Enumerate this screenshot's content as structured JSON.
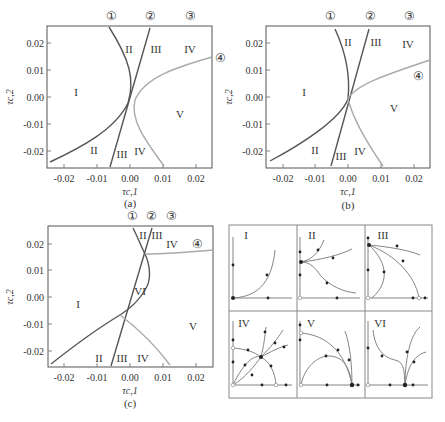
{
  "figure": {
    "panels": [
      {
        "id": "a",
        "caption": "(a)",
        "xlabel": "τc,1",
        "ylabel": "τc,2",
        "xticks": [
          "-0.02",
          "-0.01",
          "0.00",
          "0.01",
          "0.02"
        ],
        "yticks": [
          "0.02",
          "0.01",
          "0.00",
          "-0.01",
          "-0.02"
        ],
        "curve_markers": [
          "①",
          "②",
          "③",
          "④"
        ],
        "regions": [
          "I",
          "II",
          "III",
          "IV",
          "V",
          "II",
          "III",
          "IV"
        ]
      },
      {
        "id": "b",
        "caption": "(b)",
        "xlabel": "τc,1",
        "ylabel": "τc,2",
        "xticks": [
          "-0.02",
          "-0.01",
          "0.00",
          "0.01",
          "0.02"
        ],
        "yticks": [
          "0.02",
          "0.01",
          "0.00",
          "-0.01",
          "-0.02"
        ],
        "curve_markers": [
          "①",
          "②",
          "③",
          "④"
        ],
        "regions": [
          "I",
          "II",
          "III",
          "IV",
          "V",
          "II",
          "III",
          "IV"
        ]
      },
      {
        "id": "c",
        "caption": "(c)",
        "xlabel": "τc,1",
        "ylabel": "τc,2",
        "xticks": [
          "-0.02",
          "-0.01",
          "0.00",
          "0.01",
          "0.02"
        ],
        "yticks": [
          "0.02",
          "0.01",
          "0.00",
          "-0.01",
          "-0.02"
        ],
        "curve_markers": [
          "①",
          "②",
          "③",
          "④"
        ],
        "regions": [
          "I",
          "II",
          "III",
          "IV",
          "V",
          "VI",
          "II",
          "III",
          "IV"
        ]
      }
    ],
    "phase_portraits": {
      "labels": [
        "I",
        "II",
        "III",
        "IV",
        "V",
        "VI"
      ]
    },
    "colors": {
      "dark_curve": "#555555",
      "light_curve": "#aaaaaa",
      "frame": "#555555"
    }
  }
}
